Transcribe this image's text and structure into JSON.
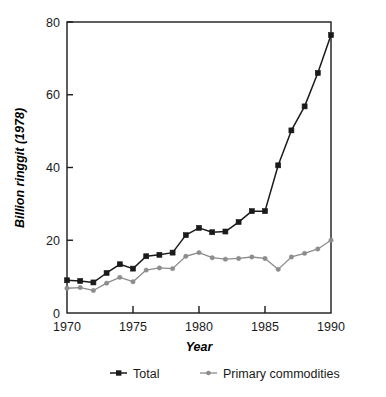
{
  "chart_data": {
    "type": "line",
    "title": "",
    "xlabel": "Year",
    "ylabel": "Billion ringgit (1978)",
    "xlim": [
      1970,
      1990
    ],
    "ylim": [
      0,
      80
    ],
    "xticks": [
      1970,
      1975,
      1980,
      1985,
      1990
    ],
    "yticks": [
      0,
      20,
      40,
      60,
      80
    ],
    "xtick_labels": [
      "1970",
      "1975",
      "1980",
      "1985",
      "1990"
    ],
    "ytick_labels": [
      "0",
      "20",
      "40",
      "60",
      "80"
    ],
    "grid": false,
    "legend_position": "bottom",
    "x": [
      1970,
      1971,
      1972,
      1973,
      1974,
      1975,
      1976,
      1977,
      1978,
      1979,
      1980,
      1981,
      1982,
      1983,
      1984,
      1985,
      1986,
      1987,
      1988,
      1989,
      1990
    ],
    "series": [
      {
        "name": "Total",
        "color": "#1a1a1a",
        "marker": "square",
        "values": [
          9.0,
          8.8,
          8.4,
          11.0,
          13.4,
          12.2,
          15.6,
          16.0,
          16.6,
          21.4,
          23.4,
          22.2,
          22.4,
          25.0,
          28.0,
          28.0,
          40.6,
          50.2,
          56.8,
          66.0,
          76.4
        ]
      },
      {
        "name": "Primary commodities",
        "color": "#8c8c8c",
        "marker": "dot",
        "values": [
          6.8,
          7.0,
          6.2,
          8.2,
          9.8,
          8.6,
          11.8,
          12.4,
          12.2,
          15.6,
          16.6,
          15.2,
          14.8,
          15.0,
          15.4,
          15.0,
          12.0,
          15.4,
          16.4,
          17.6,
          20.0
        ]
      }
    ]
  },
  "legend": {
    "items": [
      {
        "label": "Total",
        "color": "#1a1a1a"
      },
      {
        "label": "Primary commodities",
        "color": "#8c8c8c"
      }
    ]
  },
  "axes": {
    "y_axis_title": "Billion ringgit (1978)",
    "x_axis_title": "Year"
  }
}
